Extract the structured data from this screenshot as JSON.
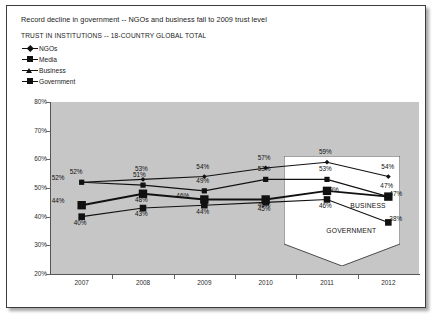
{
  "slide": {
    "title": "Record decline in government -- NGOs and business fall to 2009 trust level",
    "subtitle": "TRUST IN INSTITUTIONS -- 18-COUNTRY GLOBAL TOTAL"
  },
  "legend": {
    "items": [
      {
        "label": "NGOs",
        "marker": "diamond-marker-icon"
      },
      {
        "label": "Media",
        "marker": "square-marker-icon"
      },
      {
        "label": "Business",
        "marker": "triangle-marker-icon"
      },
      {
        "label": "Government",
        "marker": "square-marker-icon"
      }
    ]
  },
  "annotations": {
    "business_label": "BUSINESS",
    "government_label": "GOVERNMENT"
  },
  "chart_data": {
    "type": "line",
    "title": "TRUST IN INSTITUTIONS -- 18-COUNTRY GLOBAL TOTAL",
    "xlabel": "",
    "ylabel": "",
    "categories": [
      "2007",
      "2008",
      "2009",
      "2010",
      "2011",
      "2012"
    ],
    "ylim": [
      20,
      80
    ],
    "yticks": [
      "20%",
      "30%",
      "40%",
      "50%",
      "60%",
      "70%",
      "80%"
    ],
    "ytick_values": [
      20,
      30,
      40,
      50,
      60,
      70,
      80
    ],
    "grid": false,
    "legend_position": "top-left",
    "value_suffix": "%",
    "series": [
      {
        "name": "NGOs",
        "values": [
          52,
          53,
          54,
          57,
          59,
          54
        ],
        "labels": [
          "52%",
          "53%",
          "54%",
          "57%",
          "59%",
          "54%"
        ]
      },
      {
        "name": "Media",
        "values": [
          52,
          51,
          49,
          53,
          53,
          47
        ],
        "labels": [
          "52%",
          "51%",
          "49%",
          "53%",
          "53%",
          "47%"
        ]
      },
      {
        "name": "Business",
        "values": [
          44,
          48,
          46,
          46,
          49,
          47
        ],
        "labels": [
          "44%",
          "48%",
          "46%",
          "46%",
          "49%",
          "47%"
        ]
      },
      {
        "name": "Government",
        "values": [
          40,
          43,
          44,
          45,
          46,
          38
        ],
        "labels": [
          "40%",
          "43%",
          "44%",
          "45%",
          "46%",
          "38%"
        ]
      }
    ]
  }
}
